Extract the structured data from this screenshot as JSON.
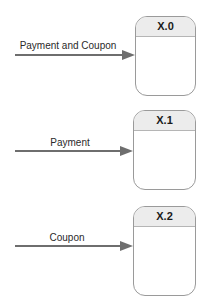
{
  "processes": [
    {
      "id": "X.0",
      "label": "X.0"
    },
    {
      "id": "X.1",
      "label": "X.1"
    },
    {
      "id": "X.2",
      "label": "X.2"
    }
  ],
  "flows": [
    {
      "label": "Payment and Coupon",
      "target": "X.0"
    },
    {
      "label": "Payment",
      "target": "X.1"
    },
    {
      "label": "Coupon",
      "target": "X.2"
    }
  ],
  "colors": {
    "arrow": "#6e6e6e",
    "box_border": "#9a9a9a",
    "header_fill": "#ececec"
  }
}
